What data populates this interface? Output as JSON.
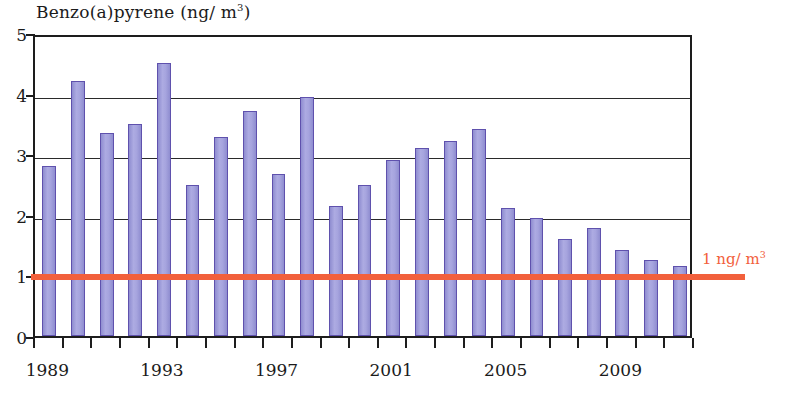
{
  "chart_data": {
    "type": "bar",
    "title_main": "Benzo(a)pyrene (ng/ m",
    "title_sup": "3",
    "title_tail": ")",
    "xlabel": "",
    "ylabel": "Benzo(a)pyrene (ng/m3)",
    "ylim": [
      0,
      5
    ],
    "xlim": [
      1988.5,
      2011.5
    ],
    "grid": true,
    "legend": "none",
    "bar_color": "#9c9ad8",
    "bar_edge_color": "#5f51ad",
    "threshold_color": "#f2603c",
    "axis_color": "#1d1d1d",
    "ytick_labels": [
      "5",
      "4",
      "3",
      "2",
      "1",
      "0"
    ],
    "ytick_values": [
      5,
      4,
      3,
      2,
      1,
      0
    ],
    "xtick_labels": [
      "1989",
      "1993",
      "1997",
      "2001",
      "2005",
      "2009"
    ],
    "xtick_values": [
      1989,
      1993,
      1997,
      2001,
      2005,
      2009
    ],
    "categories": [
      "1989",
      "1990",
      "1991",
      "1992",
      "1993",
      "1994",
      "1995",
      "1996",
      "1997",
      "1998",
      "1999",
      "2000",
      "2001",
      "2002",
      "2003",
      "2004",
      "2005",
      "2006",
      "2007",
      "2008",
      "2009",
      "2010",
      "2011"
    ],
    "values": [
      2.8,
      4.2,
      3.35,
      3.5,
      4.5,
      2.5,
      3.28,
      3.72,
      2.68,
      3.95,
      2.15,
      2.5,
      2.9,
      3.1,
      3.22,
      3.42,
      2.12,
      1.95,
      1.6,
      1.78,
      1.42,
      1.25,
      1.15
    ],
    "annotations": [
      {
        "name": "threshold",
        "label_main": "1 ng/ m",
        "label_sup": "3",
        "label_full": "1 ng/m3",
        "y_value": 1,
        "color": "#f2603c"
      }
    ]
  }
}
